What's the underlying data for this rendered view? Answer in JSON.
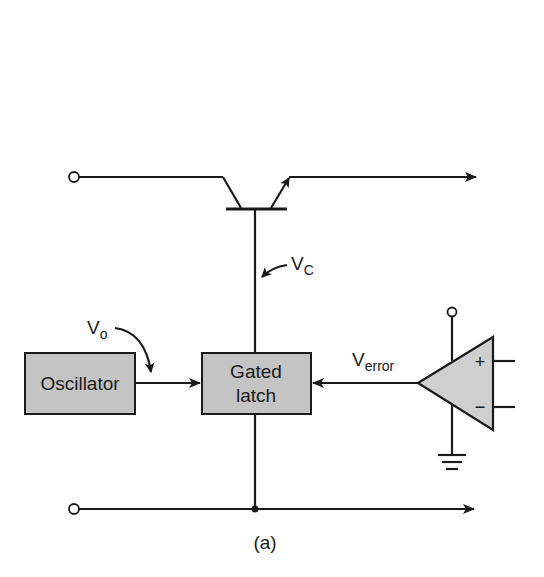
{
  "figure": {
    "caption": "(a)",
    "colors": {
      "line": "#1a1a1a",
      "block_fill": "#c4c4c4",
      "opamp_fill": "#cfcfcf",
      "background": "#ffffff"
    }
  },
  "blocks": {
    "oscillator": {
      "label": "Oscillator"
    },
    "gated_latch": {
      "line1": "Gated",
      "line2": "latch"
    }
  },
  "signals": {
    "vc": {
      "main": "V",
      "sub": "C"
    },
    "vo": {
      "main": "V",
      "sub": "o"
    },
    "verror": {
      "main": "V",
      "sub": "error"
    }
  },
  "opamp": {
    "plus_label": "+",
    "minus_label": "−"
  },
  "components": {
    "transistor": "npn-pass-transistor",
    "top_rail": "input-to-output",
    "bottom_rail": "ground-return",
    "ground": "ground-symbol"
  }
}
